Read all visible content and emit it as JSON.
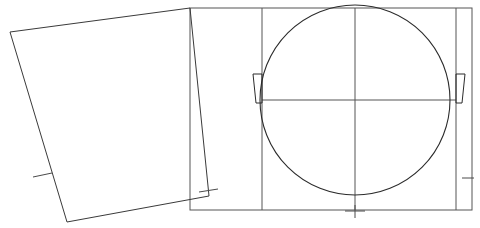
{
  "canvas": {
    "width": 480,
    "height": 228,
    "background_color": "#ffffff",
    "stroke_color": "#3a3a3a",
    "title": "Geometric line construction: rotated square, rectangle, inscribed circle"
  },
  "shapes": {
    "rotated_square": {
      "name": "rotated-square",
      "points": "10,32 190,8 209,196 67,222",
      "closed": true,
      "stroke_color": "#3a3a3a"
    },
    "outer_rectangle": {
      "name": "outer-rectangle",
      "x": 190,
      "y": 8,
      "width": 282,
      "height": 202,
      "stroke_color": "#555555"
    },
    "circle": {
      "name": "inscribed-circle",
      "cx": 355,
      "cy": 100,
      "r": 95,
      "stroke_color": "#2b2b2b"
    },
    "vertical_divider_left": {
      "name": "vertical-divider-left",
      "x": 262,
      "y1": 8,
      "y2": 210
    },
    "vertical_divider_right": {
      "name": "vertical-divider-right",
      "x": 456,
      "y1": 8,
      "y2": 210
    },
    "vertical_center_axis": {
      "name": "vertical-center-axis",
      "x": 355,
      "y1": 8,
      "y2": 210
    },
    "horizontal_center_axis": {
      "name": "horizontal-center-axis",
      "y": 100,
      "x1": 262,
      "x2": 456
    },
    "left_wedge": {
      "name": "left-wedge",
      "points": "253,74 262,74 262,103 256,103"
    },
    "right_wedge": {
      "name": "right-wedge",
      "points": "465,74 456,74 456,103 462,103"
    }
  },
  "tick_marks": [
    {
      "name": "tick-square-left-edge",
      "x1": 33,
      "y1": 177,
      "x2": 52,
      "y2": 173
    },
    {
      "name": "tick-square-bottom-right-edge",
      "x1": 199,
      "y1": 192,
      "x2": 218,
      "y2": 189
    },
    {
      "name": "tick-bottom-center",
      "x1": 345,
      "y1": 211,
      "x2": 365,
      "y2": 211
    },
    {
      "name": "tick-bottom-center-stem",
      "x1": 355,
      "y1": 205,
      "x2": 355,
      "y2": 218
    },
    {
      "name": "tick-right-edge",
      "x1": 462,
      "y1": 178,
      "x2": 474,
      "y2": 178
    }
  ],
  "legend": {
    "elements": [
      "rotated-square",
      "outer-rectangle",
      "inscribed-circle",
      "center-axes",
      "tangent-wedges",
      "tick-marks"
    ]
  }
}
